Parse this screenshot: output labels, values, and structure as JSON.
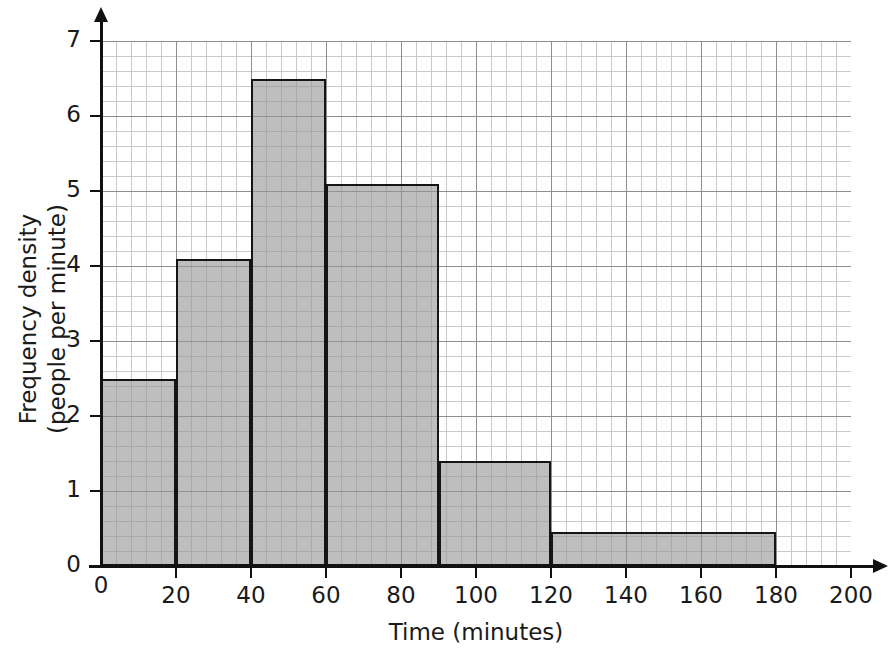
{
  "chart_data": {
    "type": "bar",
    "title": "",
    "subtitle": "",
    "xlabel": "Time (minutes)",
    "ylabel": "Frequency density\n(people per minute)",
    "ylabel_line1": "Frequency density",
    "ylabel_line2": "(people per minute)",
    "xlim": [
      0,
      200
    ],
    "ylim": [
      0,
      7
    ],
    "grid": true,
    "legend": "none",
    "xticks": [
      0,
      20,
      40,
      60,
      80,
      100,
      120,
      140,
      160,
      180,
      200
    ],
    "xtick_labels": [
      "0",
      "20",
      "40",
      "60",
      "80",
      "100",
      "120",
      "140",
      "160",
      "180",
      "200"
    ],
    "yticks": [
      0,
      1,
      2,
      3,
      4,
      5,
      6,
      7
    ],
    "ytick_labels": [
      "0",
      "1",
      "2",
      "3",
      "4",
      "5",
      "6",
      "7"
    ],
    "bar_color": "#969696",
    "bar_edge_color": "#151515",
    "grid_minor_color": "#c9c9c9",
    "grid_major_color": "#8e8e8e",
    "axis_color": "#111111",
    "bins": [
      {
        "label": "0-20",
        "x0": 0,
        "x1": 20,
        "width": 20,
        "height": 2.5,
        "frequency": 50
      },
      {
        "label": "20-40",
        "x0": 20,
        "x1": 40,
        "width": 20,
        "height": 4.1,
        "frequency": 82
      },
      {
        "label": "40-60",
        "x0": 40,
        "x1": 60,
        "width": 20,
        "height": 6.5,
        "frequency": 130
      },
      {
        "label": "60-90",
        "x0": 60,
        "x1": 90,
        "width": 30,
        "height": 5.1,
        "frequency": 153
      },
      {
        "label": "90-120",
        "x0": 90,
        "x1": 120,
        "width": 30,
        "height": 1.4,
        "frequency": 42
      },
      {
        "label": "120-180",
        "x0": 120,
        "x1": 180,
        "width": 60,
        "height": 0.45,
        "frequency": 27
      }
    ]
  }
}
